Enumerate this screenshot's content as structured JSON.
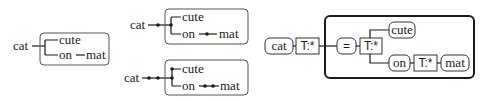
{
  "diagram": {
    "panel1": {
      "root": "cat",
      "children": [
        "cute",
        "on"
      ],
      "on_child": "mat"
    },
    "panel2_top": {
      "root": "cat",
      "children": [
        "cute",
        "on"
      ],
      "on_child": "mat"
    },
    "panel2_bottom": {
      "root": "cat",
      "children": [
        "cute",
        "on"
      ],
      "on_child": "mat"
    },
    "panel3": {
      "root": "cat",
      "root_type": "T:*",
      "eq": "=",
      "inner_type": "T:*",
      "children": [
        "cute",
        "on"
      ],
      "on_type": "T:*",
      "on_child": "mat"
    }
  }
}
